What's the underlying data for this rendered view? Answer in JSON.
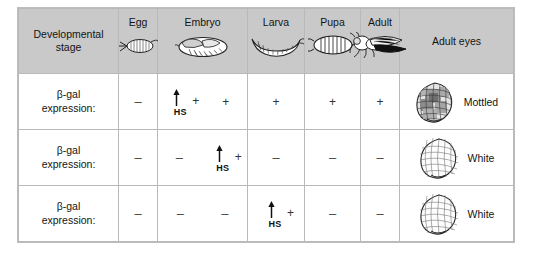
{
  "figure": {
    "header": {
      "stage_label_line1": "Developmental",
      "stage_label_line2": "stage",
      "eyes_label": "Adult eyes",
      "stages": [
        {
          "label": "Egg",
          "icon": "drosophila-egg-icon"
        },
        {
          "label": "Embryo",
          "icon": "drosophila-embryo-icon"
        },
        {
          "label": "Larva",
          "icon": "drosophila-larva-icon"
        },
        {
          "label": "Pupa",
          "icon": "drosophila-pupa-icon"
        },
        {
          "label": "Adult",
          "icon": "drosophila-adult-fly-icon"
        }
      ]
    },
    "row_label_line1": "β-gal",
    "row_label_line2": "expression:",
    "hs_label": "HS",
    "symbols": {
      "positive": "+",
      "negative": "–"
    },
    "rows": [
      {
        "egg": {
          "marks": [
            "–"
          ],
          "hs": false
        },
        "embryo": {
          "marks": [
            "+",
            "+"
          ],
          "hs": true,
          "hs_index": 0
        },
        "larva": {
          "marks": [
            "+"
          ],
          "hs": false
        },
        "pupa": {
          "marks": [
            "+"
          ],
          "hs": false
        },
        "adult": {
          "marks": [
            "+"
          ],
          "hs": false
        },
        "eye_phenotype": "Mottled",
        "eye_style": "mottled"
      },
      {
        "egg": {
          "marks": [
            "–"
          ],
          "hs": false
        },
        "embryo": {
          "marks": [
            "–",
            "+"
          ],
          "hs": true,
          "hs_index": 1
        },
        "larva": {
          "marks": [
            "–"
          ],
          "hs": false
        },
        "pupa": {
          "marks": [
            "–"
          ],
          "hs": false
        },
        "adult": {
          "marks": [
            "–"
          ],
          "hs": false
        },
        "eye_phenotype": "White",
        "eye_style": "white"
      },
      {
        "egg": {
          "marks": [
            "–"
          ],
          "hs": false
        },
        "embryo": {
          "marks": [
            "–",
            "–"
          ],
          "hs": false
        },
        "larva": {
          "marks": [
            "+"
          ],
          "hs": true,
          "hs_index": 0
        },
        "pupa": {
          "marks": [
            "–"
          ],
          "hs": false
        },
        "adult": {
          "marks": [
            "–"
          ],
          "hs": false
        },
        "eye_phenotype": "White",
        "eye_style": "white"
      }
    ],
    "colors": {
      "header_background": "#c9c9c9",
      "grid_line": "#c0c0c0",
      "text": "#141414",
      "body_background": "#ffffff"
    }
  }
}
